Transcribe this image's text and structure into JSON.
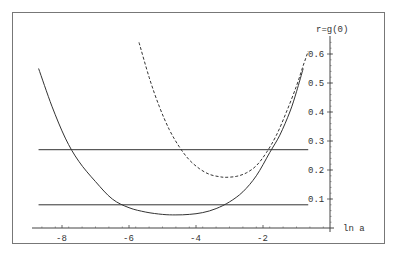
{
  "chart_data": {
    "type": "line",
    "title": "",
    "xlabel": "ln a",
    "ylabel": "r=g(0)",
    "xlim": [
      -8.7,
      0
    ],
    "ylim": [
      0,
      0.65
    ],
    "xticks": [
      -8,
      -6,
      -4,
      -2
    ],
    "xtick_labels": [
      "-8",
      "-6",
      "-4",
      "-2"
    ],
    "yticks": [
      0.1,
      0.2,
      0.3,
      0.4,
      0.5,
      0.6
    ],
    "ytick_labels": [
      "0.1",
      "0.2",
      "0.3",
      "0.4",
      "0.5",
      "0.6"
    ],
    "grid": false,
    "legend": null,
    "series": [
      {
        "name": "solid curve",
        "style": "solid",
        "x": [
          -8.7,
          -8.3,
          -7.9,
          -7.5,
          -7.0,
          -6.5,
          -6.0,
          -5.5,
          -5.0,
          -4.6,
          -4.2,
          -3.8,
          -3.4,
          -3.0,
          -2.6,
          -2.2,
          -1.8,
          -1.5,
          -1.2,
          -1.0,
          -0.8
        ],
        "y": [
          0.55,
          0.42,
          0.31,
          0.23,
          0.16,
          0.1,
          0.07,
          0.055,
          0.047,
          0.045,
          0.047,
          0.053,
          0.067,
          0.09,
          0.125,
          0.18,
          0.26,
          0.32,
          0.4,
          0.47,
          0.55
        ]
      },
      {
        "name": "dashed curve",
        "style": "dashed",
        "x": [
          -5.7,
          -5.4,
          -5.1,
          -4.8,
          -4.5,
          -4.2,
          -3.9,
          -3.6,
          -3.3,
          -3.1,
          -2.8,
          -2.5,
          -2.2,
          -1.9,
          -1.6,
          -1.3,
          -1.0,
          -0.8,
          -0.65
        ],
        "y": [
          0.64,
          0.52,
          0.42,
          0.34,
          0.28,
          0.235,
          0.205,
          0.185,
          0.177,
          0.175,
          0.178,
          0.19,
          0.215,
          0.26,
          0.32,
          0.4,
          0.49,
          0.56,
          0.61
        ]
      },
      {
        "name": "upper horizontal line",
        "style": "solid",
        "x": [
          -8.7,
          -0.65
        ],
        "y": [
          0.27,
          0.27
        ]
      },
      {
        "name": "lower horizontal line",
        "style": "solid",
        "x": [
          -8.7,
          -0.65
        ],
        "y": [
          0.08,
          0.08
        ]
      }
    ]
  }
}
